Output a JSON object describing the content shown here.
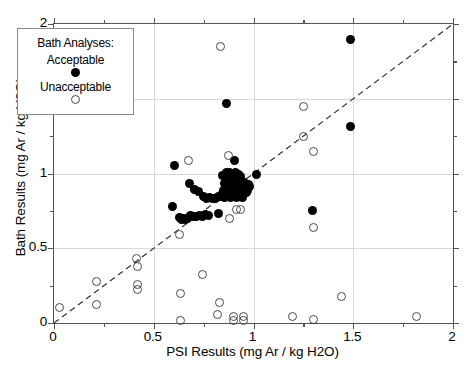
{
  "chart_data": {
    "type": "scatter",
    "title": "",
    "xlabel": "PSI Results  (mg Ar / kg H2O)",
    "ylabel": "Bath Results  (mg Ar / kg H2O)",
    "xlim": [
      0,
      2
    ],
    "ylim": [
      0,
      2
    ],
    "xticks": [
      "0",
      "0.5",
      "1",
      "1.5",
      "2"
    ],
    "yticks": [
      "0",
      "0.5",
      "1",
      "1.5",
      "2"
    ],
    "xtick_values": [
      0,
      0.5,
      1,
      1.5,
      2
    ],
    "ytick_values": [
      0,
      0.5,
      1,
      1.5,
      2
    ],
    "minor_tick_step": 0.25,
    "grid": "major gridlines at 0.5, 1, 1.5 on both axes (light gray)",
    "legend_position": "upper-left inside axes",
    "annotations": [
      {
        "type": "reference-line",
        "label": "1:1 dashed identity line",
        "from": [
          0,
          0
        ],
        "to": [
          2,
          2
        ],
        "style": "dashed"
      }
    ],
    "series": [
      {
        "name": "Acceptable",
        "marker": "filled-circle",
        "color": "#000000",
        "points": [
          [
            1.485,
            1.895
          ],
          [
            1.485,
            1.315
          ],
          [
            0.865,
            1.465
          ],
          [
            0.605,
            1.055
          ],
          [
            0.905,
            1.085
          ],
          [
            1.015,
            0.99
          ],
          [
            0.865,
            1.01
          ],
          [
            0.88,
            1.005
          ],
          [
            0.895,
            1.0
          ],
          [
            0.91,
            1.01
          ],
          [
            0.925,
            0.995
          ],
          [
            0.845,
            0.985
          ],
          [
            0.9,
            0.975
          ],
          [
            0.935,
            0.98
          ],
          [
            0.87,
            0.955
          ],
          [
            0.885,
            0.945
          ],
          [
            0.9,
            0.945
          ],
          [
            0.915,
            0.95
          ],
          [
            0.93,
            0.94
          ],
          [
            0.945,
            0.945
          ],
          [
            0.96,
            0.935
          ],
          [
            0.855,
            0.93
          ],
          [
            0.87,
            0.925
          ],
          [
            0.885,
            0.92
          ],
          [
            0.9,
            0.925
          ],
          [
            0.915,
            0.92
          ],
          [
            0.93,
            0.915
          ],
          [
            0.945,
            0.92
          ],
          [
            0.96,
            0.915
          ],
          [
            0.975,
            0.925
          ],
          [
            0.86,
            0.905
          ],
          [
            0.875,
            0.9
          ],
          [
            0.89,
            0.905
          ],
          [
            0.905,
            0.9
          ],
          [
            0.92,
            0.895
          ],
          [
            0.935,
            0.9
          ],
          [
            0.95,
            0.895
          ],
          [
            0.965,
            0.9
          ],
          [
            0.98,
            0.91
          ],
          [
            0.85,
            0.885
          ],
          [
            0.865,
            0.88
          ],
          [
            0.88,
            0.885
          ],
          [
            0.895,
            0.88
          ],
          [
            0.91,
            0.875
          ],
          [
            0.925,
            0.88
          ],
          [
            0.94,
            0.875
          ],
          [
            0.955,
            0.88
          ],
          [
            0.97,
            0.885
          ],
          [
            0.845,
            0.865
          ],
          [
            0.86,
            0.86
          ],
          [
            0.875,
            0.865
          ],
          [
            0.89,
            0.86
          ],
          [
            0.905,
            0.855
          ],
          [
            0.92,
            0.86
          ],
          [
            0.935,
            0.855
          ],
          [
            0.95,
            0.86
          ],
          [
            0.965,
            0.87
          ],
          [
            0.84,
            0.845
          ],
          [
            0.855,
            0.84
          ],
          [
            0.87,
            0.845
          ],
          [
            0.885,
            0.84
          ],
          [
            0.9,
            0.845
          ],
          [
            0.915,
            0.84
          ],
          [
            0.93,
            0.845
          ],
          [
            0.945,
            0.84
          ],
          [
            0.68,
            0.935
          ],
          [
            0.705,
            0.895
          ],
          [
            0.725,
            0.88
          ],
          [
            0.75,
            0.845
          ],
          [
            0.765,
            0.835
          ],
          [
            0.78,
            0.84
          ],
          [
            0.795,
            0.83
          ],
          [
            0.81,
            0.835
          ],
          [
            0.825,
            0.845
          ],
          [
            0.595,
            0.78
          ],
          [
            0.63,
            0.705
          ],
          [
            0.64,
            0.695
          ],
          [
            0.65,
            0.7
          ],
          [
            0.66,
            0.69
          ],
          [
            0.67,
            0.7
          ],
          [
            0.685,
            0.72
          ],
          [
            0.7,
            0.715
          ],
          [
            0.715,
            0.71
          ],
          [
            0.73,
            0.72
          ],
          [
            0.745,
            0.715
          ],
          [
            0.76,
            0.725
          ],
          [
            0.775,
            0.72
          ],
          [
            0.825,
            0.735
          ],
          [
            1.295,
            0.755
          ]
        ]
      },
      {
        "name": "Unacceptable",
        "marker": "open-circle",
        "color": "#4a4a4a",
        "points": [
          [
            0.835,
            1.85
          ],
          [
            1.25,
            1.45
          ],
          [
            1.25,
            1.25
          ],
          [
            1.3,
            1.15
          ],
          [
            0.875,
            1.12
          ],
          [
            0.675,
            1.085
          ],
          [
            0.915,
            0.76
          ],
          [
            0.935,
            0.76
          ],
          [
            0.88,
            0.7
          ],
          [
            1.3,
            0.64
          ],
          [
            0.63,
            0.595
          ],
          [
            0.415,
            0.43
          ],
          [
            0.42,
            0.375
          ],
          [
            0.42,
            0.255
          ],
          [
            0.42,
            0.225
          ],
          [
            0.215,
            0.275
          ],
          [
            0.215,
            0.125
          ],
          [
            0.03,
            0.105
          ],
          [
            0.745,
            0.325
          ],
          [
            0.635,
            0.2
          ],
          [
            0.83,
            0.14
          ],
          [
            1.44,
            0.175
          ],
          [
            0.82,
            0.055
          ],
          [
            0.9,
            0.045
          ],
          [
            0.9,
            0.02
          ],
          [
            0.95,
            0.045
          ],
          [
            0.95,
            0.02
          ],
          [
            0.635,
            0.02
          ],
          [
            1.195,
            0.045
          ],
          [
            1.3,
            0.025
          ],
          [
            1.815,
            0.045
          ]
        ]
      }
    ]
  },
  "legend": {
    "title": "Bath Analyses:",
    "entries": [
      {
        "label": "Acceptable",
        "marker": "filled-circle"
      },
      {
        "label": "Unacceptable",
        "marker": "open-circle"
      }
    ]
  }
}
